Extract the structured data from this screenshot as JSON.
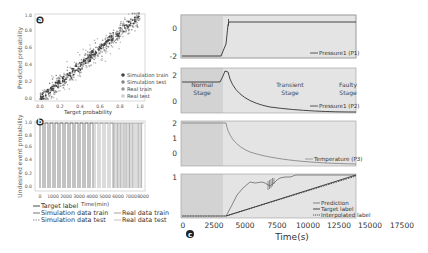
{
  "figure": {
    "panels": [
      "a",
      "b",
      "c"
    ]
  },
  "panel_a": {
    "label": "a",
    "xlabel": "Target probability",
    "ylabel": "Predicted probability",
    "xticks": [
      "0.0",
      "0.2",
      "0.4",
      "0.6",
      "0.8",
      "1.0"
    ],
    "yticks": [
      "0.0",
      "0.2",
      "0.4",
      "0.6",
      "0.8",
      "1.0"
    ],
    "legend": [
      "Simulation train",
      "Simulation test",
      "Real train",
      "Real test"
    ]
  },
  "panel_b": {
    "label": "b",
    "xlabel": "Time(min)",
    "ylabel": "Undesired event probability",
    "xticks": [
      "0",
      "1000",
      "2000",
      "3000",
      "4000",
      "5000",
      "6000",
      "7000",
      "8000"
    ],
    "yticks": [
      "0.0",
      "0.2",
      "0.4",
      "0.6",
      "0.8",
      "1.0"
    ],
    "legend": [
      "Target label",
      "Simulation data train",
      "Simulation data test",
      "Real data train",
      "Real data test"
    ]
  },
  "panel_c": {
    "label": "c",
    "xlabel": "Time(s)",
    "xticks": [
      "0",
      "2500",
      "5000",
      "7500",
      "10000",
      "12500",
      "15000",
      "17500"
    ],
    "subplots": [
      {
        "legend": "Pressure1 (P1)",
        "yticks": [
          "0",
          "-2"
        ]
      },
      {
        "legend": "Pressure1 (P2)",
        "yticks": [
          "2",
          "0"
        ],
        "stages": [
          {
            "line1": "Normal",
            "line2": "Stage"
          },
          {
            "line1": "Transient",
            "line2": "Stage"
          },
          {
            "line1": "Faulty",
            "line2": "Stage"
          }
        ]
      },
      {
        "legend": "Temperature (P3)",
        "yticks": [
          "2",
          "1",
          "0"
        ]
      },
      {
        "legend": [
          "Prediction",
          "Target label",
          "Interpolated label"
        ],
        "yticks": [
          "1"
        ]
      }
    ]
  },
  "colors": {
    "shade_normal": "#d4d4d4",
    "shade_rest": "#e3e3e3",
    "line_dark": "#333333",
    "line_mid": "#777777",
    "scatter_dark": "#444444",
    "scatter_mid": "#888888",
    "scatter_light": "#bbbbbb"
  },
  "chart_data": [
    {
      "type": "scatter",
      "title": "a",
      "xlabel": "Target probability",
      "ylabel": "Predicted probability",
      "xlim": [
        0,
        1
      ],
      "ylim": [
        0,
        1
      ],
      "series": [
        {
          "name": "Simulation train",
          "trend": "y ≈ x",
          "spread": 0.03
        },
        {
          "name": "Simulation test",
          "trend": "y ≈ x",
          "spread": 0.05
        },
        {
          "name": "Real train",
          "trend": "y ≈ x",
          "spread": 0.05
        },
        {
          "name": "Real test",
          "trend": "y ≈ x",
          "spread": 0.08
        }
      ],
      "legend_position": "lower right"
    },
    {
      "type": "line",
      "title": "b",
      "xlabel": "Time(min)",
      "ylabel": "Undesired event probability",
      "xlim": [
        0,
        8000
      ],
      "ylim": [
        0,
        1
      ],
      "description": "Repeated square-like pulses between 0 and 1; ~13 regular pulses 0–5500 min, dense pulses 5800–8000 min",
      "series": [
        "Target label",
        "Simulation data train",
        "Simulation data test",
        "Real data train",
        "Real data test"
      ],
      "legend_position": "below"
    },
    {
      "type": "line",
      "title": "c",
      "xlabel": "Time(s)",
      "xlim": [
        0,
        17500
      ],
      "subplots": [
        {
          "name": "Pressure1 (P1)",
          "ylim": [
            -2.2,
            0.8
          ],
          "x": [
            0,
            2900,
            3300,
            3400,
            3450,
            17500
          ],
          "y": [
            -2.1,
            -2.1,
            -1.2,
            0.2,
            0.3,
            0.3
          ]
        },
        {
          "name": "Pressure1 (P2)",
          "ylim": [
            -0.3,
            2.8
          ],
          "x": [
            0,
            2900,
            3200,
            3500,
            4500,
            7000,
            10000,
            14000,
            17500
          ],
          "y": [
            1.6,
            1.6,
            2.3,
            2.2,
            1.1,
            0.45,
            0.2,
            0.08,
            0.05
          ]
        },
        {
          "name": "Temperature (P3)",
          "ylim": [
            -0.8,
            2.1
          ],
          "x": [
            0,
            3300,
            3500,
            4500,
            7000,
            10000,
            14000,
            17500
          ],
          "y": [
            2.0,
            2.0,
            1.3,
            0.55,
            0.15,
            -0.25,
            -0.5,
            -0.55
          ]
        },
        {
          "name": "Prediction",
          "ylim": [
            0,
            1.05
          ],
          "x": [
            0,
            3300,
            4200,
            4900,
            6200,
            6800,
            7200,
            8300,
            9200,
            9600,
            17500
          ],
          "y": [
            0.03,
            0.03,
            0.35,
            0.7,
            0.72,
            0.55,
            0.8,
            0.85,
            0.85,
            1.0,
            1.0
          ]
        },
        {
          "name": "Target label",
          "x": [
            0,
            3300,
            3350,
            17500
          ],
          "y": [
            0.03,
            0.03,
            0.03,
            1.0
          ]
        },
        {
          "name": "Interpolated label",
          "x": [
            0,
            3300,
            14500,
            17500
          ],
          "y": [
            0.03,
            0.03,
            1.0,
            1.0
          ]
        }
      ],
      "stages": [
        "Normal Stage",
        "Transient Stage",
        "Faulty Stage"
      ]
    }
  ]
}
